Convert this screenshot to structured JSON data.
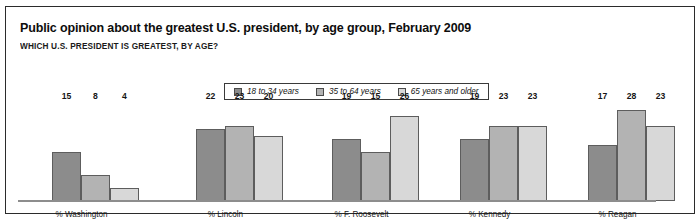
{
  "header": {
    "title": "Public opinion about the greatest U.S. president, by age group, February 2009",
    "subtitle": "WHICH U.S. PRESIDENT IS GREATEST, BY AGE?"
  },
  "legend": {
    "items": [
      {
        "label": "18 to 34 years",
        "color": "#8c8c8c"
      },
      {
        "label": "35 to 64 years",
        "color": "#b3b3b3"
      },
      {
        "label": "65 years and older",
        "color": "#d8d8d8"
      }
    ]
  },
  "chart_data": {
    "type": "bar",
    "title": "Public opinion about the greatest U.S. president, by age group, February 2009",
    "subtitle": "WHICH U.S. PRESIDENT IS GREATEST, BY AGE?",
    "xlabel": "",
    "ylabel": "",
    "ylim": [
      0,
      30
    ],
    "grid": false,
    "legend_position": "top-center",
    "categories": [
      "% Washington",
      "% Lincoln",
      "% F. Roosevelt",
      "% Kennedy",
      "% Reagan"
    ],
    "series": [
      {
        "name": "18 to 34 years",
        "color": "#8c8c8c",
        "values": [
          15,
          22,
          19,
          19,
          17
        ]
      },
      {
        "name": "35 to 64 years",
        "color": "#b3b3b3",
        "values": [
          8,
          23,
          15,
          23,
          28
        ]
      },
      {
        "name": "65 years and older",
        "color": "#d8d8d8",
        "values": [
          4,
          20,
          26,
          23,
          23
        ]
      }
    ]
  }
}
